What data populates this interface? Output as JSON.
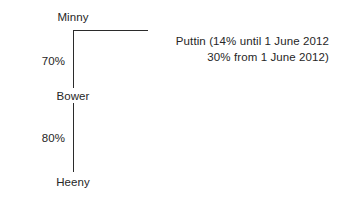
{
  "diagram": {
    "type": "ownership-tree",
    "nodes": [
      {
        "id": "minny",
        "label": "Minny"
      },
      {
        "id": "bower",
        "label": "Bower"
      },
      {
        "id": "heeny",
        "label": "Heeny"
      }
    ],
    "edges": [
      {
        "from": "minny",
        "to": "bower",
        "label": "70%"
      },
      {
        "from": "bower",
        "to": "heeny",
        "label": "80%"
      }
    ],
    "annotation": {
      "line1": "Puttin (14% until 1 June 2012",
      "line2": "30% from 1 June 2012)"
    }
  },
  "colors": {
    "line": "#2b2b2b",
    "text": "#262626",
    "background": "#ffffff"
  }
}
